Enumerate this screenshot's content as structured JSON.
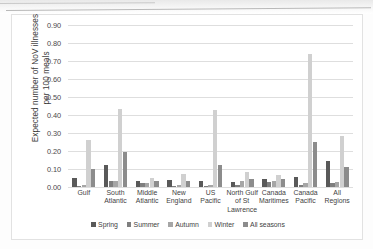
{
  "chart_data": {
    "type": "bar",
    "title": "",
    "xlabel": "",
    "ylabel": "Expected number of NoV illnesses\nper 100 meals",
    "ylim": [
      0,
      0.9
    ],
    "ytick_labels": [
      "0.00",
      "0.10",
      "0.20",
      "0.30",
      "0.40",
      "0.50",
      "0.60",
      "0.70",
      "0.80",
      "0.90"
    ],
    "ytick_values": [
      0,
      0.1,
      0.2,
      0.3,
      0.4,
      0.5,
      0.6,
      0.7,
      0.8,
      0.9
    ],
    "grid": true,
    "legend_position": "bottom",
    "categories": [
      "Gulf",
      "South\nAtlantic",
      "Middle\nAtlantic",
      "New\nEngland",
      "US Pacific",
      "North Gulf\nof St\nLawrence",
      "Canada\nMaritimes",
      "Canada\nPacific",
      "All Regions"
    ],
    "series": [
      {
        "name": "Spring",
        "color": "#595959",
        "values": [
          0.05,
          0.124,
          0.031,
          0.037,
          0.034,
          0.03,
          0.047,
          0.055,
          0.145
        ]
      },
      {
        "name": "Summer",
        "color": "#7f7f7f",
        "values": [
          0.008,
          0.036,
          0.02,
          0.007,
          0.006,
          0.009,
          0.03,
          0.012,
          0.02
        ]
      },
      {
        "name": "Autumn",
        "color": "#a6a6a6",
        "values": [
          0.012,
          0.035,
          0.022,
          0.01,
          0.01,
          0.034,
          0.033,
          0.025,
          0.026
        ]
      },
      {
        "name": "Winter",
        "color": "#d0d0d0",
        "values": [
          0.262,
          0.432,
          0.052,
          0.07,
          0.43,
          0.084,
          0.069,
          0.74,
          0.285
        ]
      },
      {
        "name": "All seasons",
        "color": "#8c8c8c",
        "values": [
          0.101,
          0.193,
          0.034,
          0.031,
          0.123,
          0.045,
          0.044,
          0.25,
          0.11
        ]
      }
    ]
  },
  "legend": {
    "items": [
      "Spring",
      "Summer",
      "Autumn",
      "Winter",
      "All seasons"
    ]
  }
}
